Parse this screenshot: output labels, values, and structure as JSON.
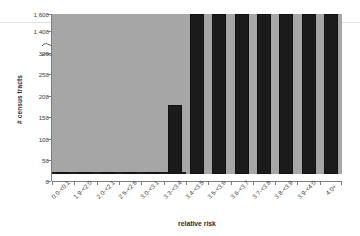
{
  "chart_data": {
    "type": "bar",
    "title": "",
    "xlabel": "relative risk",
    "ylabel": "# census tracts",
    "categories": [
      "0.0-<0.1",
      "1.9-<2.0",
      "2.0-<2.1",
      "2.5-<2.6",
      "3.0-<3.1",
      "3.3-<3.4",
      "3.4-<3.5",
      "3.5-<3.6",
      "3.6-<3.7",
      "3.7-<3.8",
      "3.8-<3.9",
      "3.9-<4.0",
      "4.0+"
    ],
    "values": [
      1450,
      2,
      2,
      2,
      2,
      2,
      2,
      2,
      2,
      3,
      3,
      3,
      163
    ],
    "bar_colors": [
      "#a6a6a6",
      "#1b1b1b",
      "#1b1b1b",
      "#1b1b1b",
      "#1b1b1b",
      "#1b1b1b",
      "#1b1b1b",
      "#1b1b1b",
      "#1b1b1b",
      "#1b1b1b",
      "#1b1b1b",
      "#1b1b1b",
      "#1b1b1b"
    ],
    "ylim": [
      0,
      1600
    ],
    "y_axis_break": true,
    "y_break_range": [
      300,
      1400
    ],
    "yticks": [
      "0",
      "50",
      "100",
      "150",
      "200",
      "250",
      "300",
      "1,400",
      "1,600"
    ],
    "ytick_values": [
      0,
      50,
      100,
      150,
      200,
      250,
      300,
      1400,
      1600
    ],
    "grid": false,
    "legend": "none"
  }
}
